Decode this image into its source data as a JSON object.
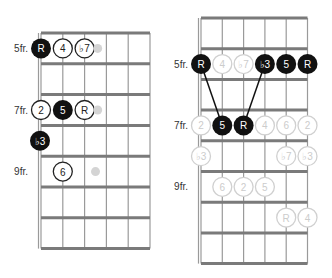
{
  "diagrams": [
    {
      "id": "left",
      "origin": {
        "x": 41,
        "y": 33
      },
      "string_spacing": 21.8,
      "fret_spacing": 30.8,
      "num_frets": 7,
      "num_strings": 6,
      "fret_labels": [
        {
          "text": "5fr.",
          "fret_row": 0.5
        },
        {
          "text": "7fr.",
          "fret_row": 2.5
        },
        {
          "text": "9fr.",
          "fret_row": 4.5
        }
      ],
      "notes": [
        {
          "label": "R",
          "string": 0,
          "row": 0.5,
          "style": "filled"
        },
        {
          "label": "4",
          "string": 1,
          "row": 0.5,
          "style": "outline"
        },
        {
          "label": "♭7",
          "string": 2,
          "row": 0.5,
          "style": "outline"
        },
        {
          "label": "",
          "string": 2.6,
          "row": 0.5,
          "style": "ghost-small"
        },
        {
          "label": "2",
          "string": 0,
          "row": 2.5,
          "style": "outline"
        },
        {
          "label": "5",
          "string": 1,
          "row": 2.5,
          "style": "filled"
        },
        {
          "label": "R",
          "string": 2,
          "row": 2.5,
          "style": "outline"
        },
        {
          "label": "",
          "string": 2.6,
          "row": 2.5,
          "style": "ghost-small"
        },
        {
          "label": "♭3",
          "string": 0,
          "row": 3.5,
          "style": "filled",
          "offset_x": -1
        },
        {
          "label": "6",
          "string": 1,
          "row": 4.5,
          "style": "outline"
        },
        {
          "label": "",
          "string": 2.5,
          "row": 4.5,
          "style": "ghost-small"
        }
      ],
      "connectors": []
    },
    {
      "id": "right",
      "origin": {
        "x": 201,
        "y": 18
      },
      "string_spacing": 21.3,
      "fret_spacing": 30.7,
      "num_frets": 8,
      "num_strings": 6,
      "fret_labels": [
        {
          "text": "5fr.",
          "fret_row": 1.5
        },
        {
          "text": "7fr.",
          "fret_row": 3.5
        },
        {
          "text": "9fr.",
          "fret_row": 5.5
        }
      ],
      "notes": [
        {
          "label": "R",
          "string": 0,
          "row": 1.5,
          "style": "filled"
        },
        {
          "label": "4",
          "string": 1,
          "row": 1.5,
          "style": "faded"
        },
        {
          "label": "♭7",
          "string": 2,
          "row": 1.5,
          "style": "faded"
        },
        {
          "label": "♭3",
          "string": 3,
          "row": 1.5,
          "style": "filled"
        },
        {
          "label": "5",
          "string": 4,
          "row": 1.5,
          "style": "filled"
        },
        {
          "label": "R",
          "string": 5,
          "row": 1.5,
          "style": "filled"
        },
        {
          "label": "2",
          "string": 0,
          "row": 3.5,
          "style": "faded"
        },
        {
          "label": "5",
          "string": 1,
          "row": 3.5,
          "style": "filled"
        },
        {
          "label": "R",
          "string": 2,
          "row": 3.5,
          "style": "filled"
        },
        {
          "label": "4",
          "string": 3,
          "row": 3.5,
          "style": "faded"
        },
        {
          "label": "6",
          "string": 4,
          "row": 3.5,
          "style": "faded"
        },
        {
          "label": "2",
          "string": 5,
          "row": 3.5,
          "style": "faded"
        },
        {
          "label": "♭3",
          "string": 0,
          "row": 4.5,
          "style": "faded"
        },
        {
          "label": "♭7",
          "string": 4,
          "row": 4.5,
          "style": "faded"
        },
        {
          "label": "♭3",
          "string": 5,
          "row": 4.5,
          "style": "faded"
        },
        {
          "label": "6",
          "string": 1,
          "row": 5.5,
          "style": "faded"
        },
        {
          "label": "2",
          "string": 2,
          "row": 5.5,
          "style": "faded"
        },
        {
          "label": "5",
          "string": 3,
          "row": 5.5,
          "style": "faded"
        },
        {
          "label": "R",
          "string": 4,
          "row": 6.5,
          "style": "faded"
        },
        {
          "label": "4",
          "string": 5,
          "row": 6.5,
          "style": "faded"
        }
      ],
      "connectors": [
        {
          "from": [
            0,
            1.5
          ],
          "to": [
            1,
            3.5
          ]
        },
        {
          "from": [
            3,
            1.5
          ],
          "to": [
            2,
            3.5
          ]
        }
      ]
    }
  ],
  "colors": {
    "filled": "#111111",
    "outline_stroke": "#222222",
    "faded_stroke": "#d0d0d0",
    "faded_text": "#cccccc",
    "ghost": "#d4d4d4"
  }
}
